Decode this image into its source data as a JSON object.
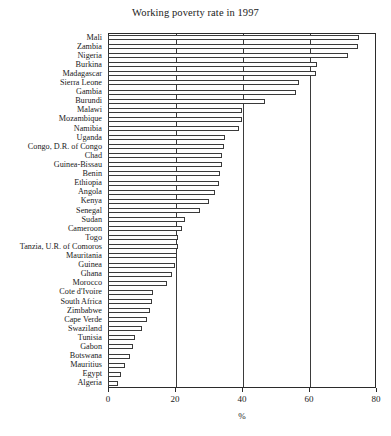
{
  "chart_data": {
    "type": "bar",
    "orientation": "horizontal",
    "title": "Working poverty rate in 1997",
    "xlabel": "%",
    "ylabel": "",
    "xlim": [
      0,
      80
    ],
    "xticks": [
      0,
      20,
      40,
      60,
      80
    ],
    "xtick_labels": [
      "0",
      "20",
      "40",
      "60",
      "80"
    ],
    "grid": true,
    "grid_axis": "x",
    "legend": false,
    "bar_style": "hollow-outline",
    "categories": [
      "Mali",
      "Zambia",
      "Nigeria",
      "Burkina",
      "Madagascar",
      "Sierra Leone",
      "Gambia",
      "Burundi",
      "Malawi",
      "Mozambique",
      "Namibia",
      "Uganda",
      "Congo, D.R. of Congo",
      "Chad",
      "Guinea-Bissau",
      "Benin",
      "Ethiopia",
      "Angola",
      "Kenya",
      "Senegal",
      "Sudan",
      "Cameroon",
      "Togo",
      "Tanzia, U.R. of Comoros",
      "Mauritania",
      "Guinea",
      "Ghana",
      "Morocco",
      "Cote d'Ivoire",
      "South Africa",
      "Zimbabwe",
      "Cape Verde",
      "Swaziland",
      "Tunisia",
      "Gabon",
      "Botswana",
      "Mauritius",
      "Egypt",
      "Algeria"
    ],
    "values": [
      75.0,
      74.5,
      71.5,
      62.5,
      62.0,
      57.0,
      56.0,
      47.0,
      40.0,
      40.0,
      39.0,
      35.0,
      34.5,
      34.0,
      34.0,
      33.5,
      33.0,
      32.0,
      30.0,
      27.5,
      23.0,
      22.0,
      21.0,
      21.0,
      20.5,
      20.0,
      19.0,
      17.5,
      13.5,
      13.0,
      12.5,
      11.5,
      10.0,
      8.0,
      7.5,
      6.5,
      5.0,
      4.0,
      3.0
    ]
  }
}
